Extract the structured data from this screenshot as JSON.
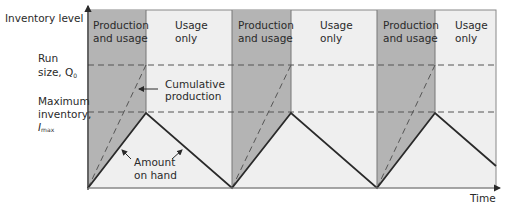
{
  "diagram": {
    "y_axis_label": "Inventory level",
    "x_axis_label": "Time",
    "levels": {
      "run_size": {
        "label_line1": "Run",
        "label_line2": "size, Q",
        "subscript": "0"
      },
      "max_inventory": {
        "label_line1": "Maximum",
        "label_line2": "inventory,",
        "label_line3": "I",
        "subscript": "max"
      }
    },
    "phases": {
      "production": {
        "line1": "Production",
        "line2": "and usage"
      },
      "usage": {
        "line1": "Usage",
        "line2": "only"
      }
    },
    "annotations": {
      "cumulative": {
        "line1": "Cumulative",
        "line2": "production"
      },
      "amount": {
        "line1": "Amount",
        "line2": "on hand"
      }
    },
    "cycles": 3,
    "colors": {
      "production_shade": "#b4b4b4",
      "background": "#efefef",
      "line": "#2a2a2a",
      "dash": "#555555"
    }
  }
}
